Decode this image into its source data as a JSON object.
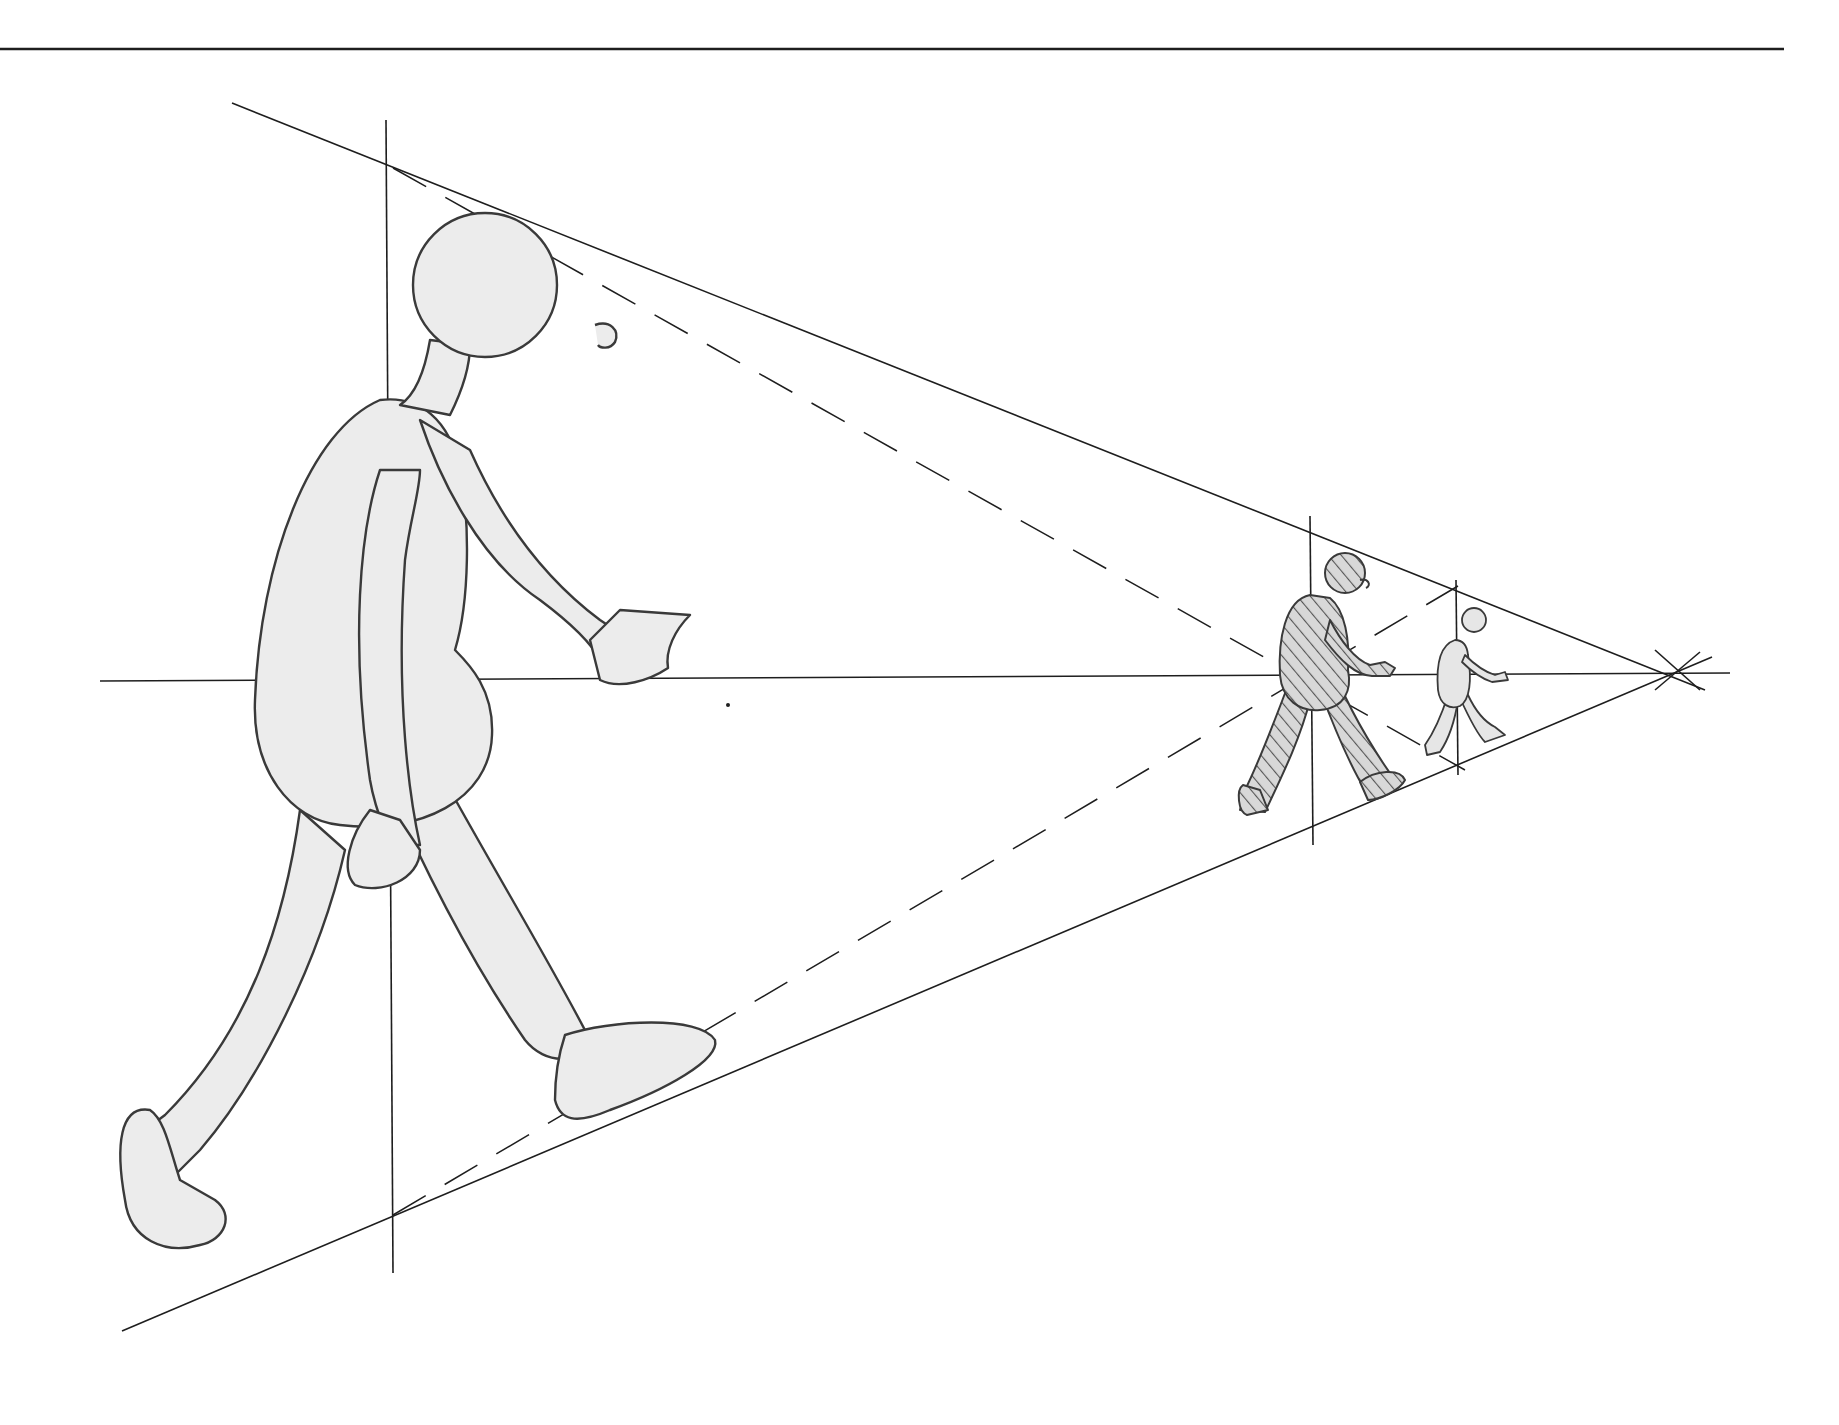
{
  "diagram": {
    "type": "perspective-drawing",
    "colors": {
      "line": "#1e1e1e",
      "figure_fill": "#e6e6e6",
      "hatch": "#555555",
      "background": "#ffffff"
    },
    "elements": {
      "top_rule": "horizontal rule",
      "horizon_line": "horizon / eye level line",
      "vanishing_point": "vanishing point",
      "upper_convergence_line": "line from head tops to vanishing point",
      "lower_convergence_line": "line from feet to vanishing point",
      "dashed_guides": "dashed construction lines",
      "figures": [
        {
          "name": "large-foreground-figure",
          "shading": "plain"
        },
        {
          "name": "medium-figure",
          "shading": "hatched"
        },
        {
          "name": "small-figure",
          "shading": "plain"
        }
      ]
    }
  }
}
